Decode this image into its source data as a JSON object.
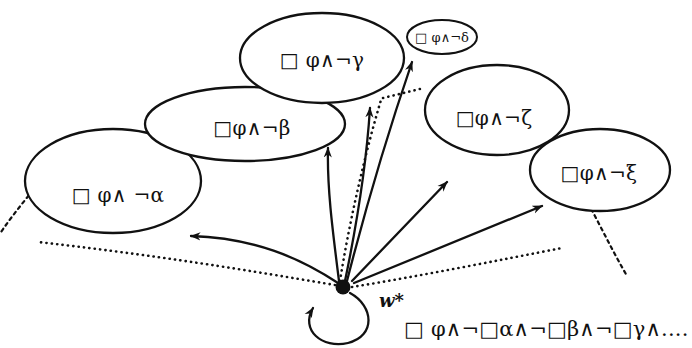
{
  "diagram": {
    "center_world": {
      "name": "center-world-node",
      "label": "w*",
      "x": 343,
      "y": 287
    },
    "center_formula": {
      "label": "□ φ∧¬□α∧¬□β∧¬□γ∧....",
      "x": 404,
      "y": 330
    },
    "clusters": [
      {
        "id": "alpha",
        "label": "□ φ∧ ¬α",
        "cx": 113,
        "cy": 181,
        "rx": 88,
        "ry": 52,
        "label_x": 118,
        "label_y": 196
      },
      {
        "id": "beta",
        "label": "□φ∧¬β",
        "cx": 245,
        "cy": 124,
        "rx": 100,
        "ry": 37,
        "label_x": 252,
        "label_y": 129
      },
      {
        "id": "gamma",
        "label": "□ φ∧¬γ",
        "cx": 322,
        "cy": 58,
        "rx": 82,
        "ry": 45,
        "label_x": 322,
        "label_y": 61
      },
      {
        "id": "delta",
        "label": "□ φ∧¬δ",
        "cx": 442,
        "cy": 37,
        "rx": 35,
        "ry": 17,
        "label_x": 442,
        "label_y": 38
      },
      {
        "id": "zeta",
        "label": "□φ∧¬ζ",
        "cx": 497,
        "cy": 110,
        "rx": 72,
        "ry": 45,
        "label_x": 494,
        "label_y": 119
      },
      {
        "id": "xi",
        "label": "□φ∧¬ξ",
        "cx": 600,
        "cy": 170,
        "rx": 70,
        "ry": 41,
        "label_x": 599,
        "label_y": 174
      }
    ],
    "edges": [
      {
        "id": "edge-to-alpha",
        "kind": "solid-arrow",
        "target": "alpha"
      },
      {
        "id": "edge-to-beta",
        "kind": "solid-arrow",
        "target": "beta"
      },
      {
        "id": "edge-to-gamma",
        "kind": "solid-arrow",
        "target": "gamma"
      },
      {
        "id": "edge-to-delta",
        "kind": "solid-arrow",
        "target": "delta"
      },
      {
        "id": "edge-to-zeta",
        "kind": "solid-arrow",
        "target": "zeta"
      },
      {
        "id": "edge-to-xi",
        "kind": "solid-arrow",
        "target": "xi"
      },
      {
        "id": "edge-dotted-left",
        "kind": "dotted",
        "target": "alpha"
      },
      {
        "id": "edge-dotted-up",
        "kind": "dotted",
        "target": "gamma"
      },
      {
        "id": "edge-dotted-delta",
        "kind": "dotted",
        "target": "delta"
      },
      {
        "id": "edge-dotted-right",
        "kind": "dotted",
        "target": "zeta"
      },
      {
        "id": "self-loop",
        "kind": "solid-arrow",
        "target": "center-world-node"
      }
    ],
    "continuation_marks": [
      {
        "id": "continuation-left",
        "kind": "dashed"
      },
      {
        "id": "continuation-right",
        "kind": "dashed"
      }
    ]
  }
}
